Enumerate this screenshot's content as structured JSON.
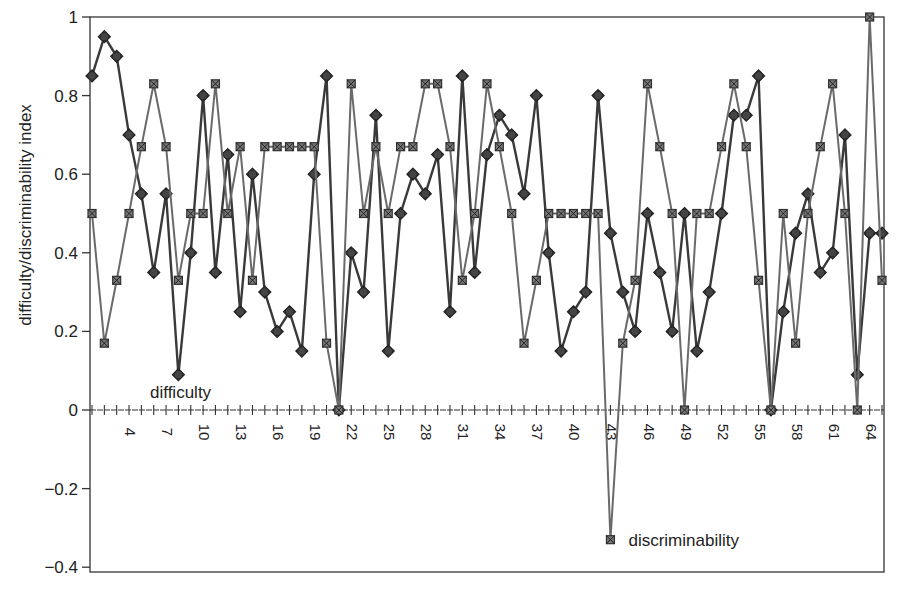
{
  "chart_data": {
    "type": "line",
    "title": "",
    "xlabel": "",
    "ylabel": "difficulty/discriminability index",
    "ylim": [
      -0.4,
      1
    ],
    "xlim": [
      1,
      65
    ],
    "yticks": [
      -0.4,
      -0.2,
      0,
      0.2,
      0.4,
      0.6,
      0.8,
      1
    ],
    "ytick_labels": [
      "-0.4",
      "-0.2",
      "0",
      "0.2",
      "0.4",
      "0.6",
      "0.8",
      "1"
    ],
    "xtick_labels": [
      "4",
      "7",
      "10",
      "13",
      "16",
      "19",
      "22",
      "25",
      "28",
      "31",
      "34",
      "37",
      "40",
      "43",
      "46",
      "49",
      "52",
      "55",
      "58",
      "61",
      "64"
    ],
    "grid": false,
    "legend": "inline annotations",
    "annotations": [
      {
        "text": "difficulty",
        "x": 8,
        "y": 0.05
      },
      {
        "text": "discriminability",
        "x": 43,
        "y": -0.33
      }
    ],
    "x": [
      1,
      2,
      3,
      4,
      5,
      6,
      7,
      8,
      9,
      10,
      11,
      12,
      13,
      14,
      15,
      16,
      17,
      18,
      19,
      20,
      21,
      22,
      23,
      24,
      25,
      26,
      27,
      28,
      29,
      30,
      31,
      32,
      33,
      34,
      35,
      36,
      37,
      38,
      39,
      40,
      41,
      42,
      43,
      44,
      45,
      46,
      47,
      48,
      49,
      50,
      51,
      52,
      53,
      54,
      55,
      56,
      57,
      58,
      59,
      60,
      61,
      62,
      63,
      64,
      65
    ],
    "series": [
      {
        "name": "difficulty",
        "marker": "circle",
        "values": [
          0.85,
          0.95,
          0.9,
          0.7,
          0.55,
          0.35,
          0.55,
          0.09,
          0.4,
          0.8,
          0.35,
          0.65,
          0.25,
          0.6,
          0.3,
          0.2,
          0.25,
          0.15,
          0.6,
          0.85,
          0,
          0.4,
          0.3,
          0.75,
          0.15,
          0.5,
          0.6,
          0.55,
          0.65,
          0.25,
          0.85,
          0.35,
          0.65,
          0.75,
          0.7,
          0.55,
          0.8,
          0.4,
          0.15,
          0.25,
          0.3,
          0.8,
          0.45,
          0.3,
          0.2,
          0.5,
          0.35,
          0.2,
          0.5,
          0.15,
          0.3,
          0.5,
          0.75,
          0.75,
          0.85,
          0,
          0.25,
          0.45,
          0.55,
          0.35,
          0.4,
          0.7,
          0.09,
          0.45,
          0.45
        ]
      },
      {
        "name": "discriminability",
        "marker": "square",
        "values": [
          0.5,
          0.17,
          0.33,
          0.5,
          0.67,
          0.83,
          0.67,
          0.33,
          0.5,
          0.5,
          0.83,
          0.5,
          0.67,
          0.33,
          0.67,
          0.67,
          0.67,
          0.67,
          0.67,
          0.17,
          0,
          0.83,
          0.5,
          0.67,
          0.5,
          0.67,
          0.67,
          0.83,
          0.83,
          0.67,
          0.33,
          0.5,
          0.83,
          0.67,
          0.5,
          0.17,
          0.33,
          0.5,
          0.5,
          0.5,
          0.5,
          0.5,
          -0.33,
          0.17,
          0.33,
          0.83,
          0.67,
          0.5,
          0,
          0.5,
          0.5,
          0.67,
          0.83,
          0.67,
          0.33,
          0,
          0.5,
          0.17,
          0.5,
          0.67,
          0.83,
          0.5,
          0,
          1.0,
          0.33
        ]
      }
    ],
    "colors": {
      "difficulty": "#3a3a3a",
      "discriminability": "#6a6a6a",
      "axis": "#333333"
    }
  }
}
